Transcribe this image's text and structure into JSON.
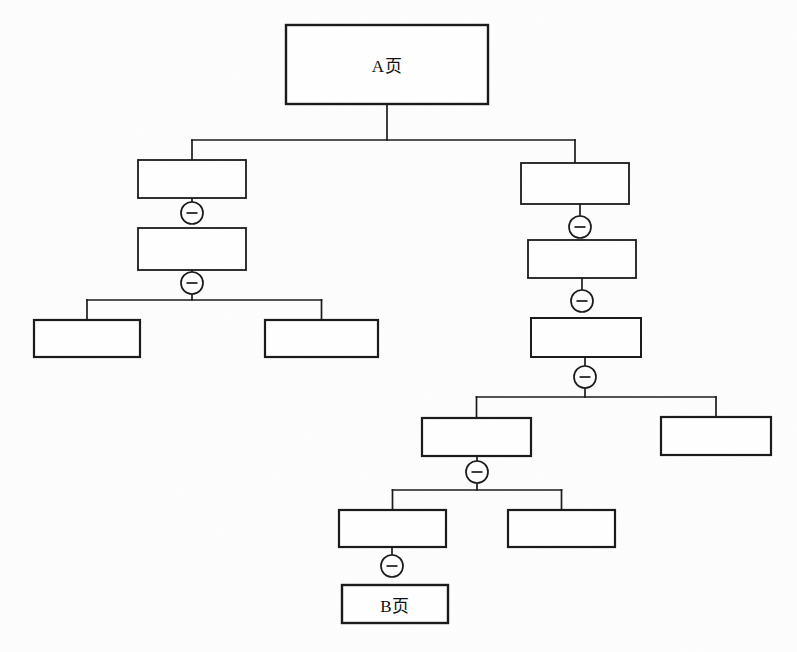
{
  "diagram": {
    "type": "tree-hierarchy",
    "title": "",
    "background_color": "#fdfdfd",
    "line_color": "#1a1a1a",
    "box_fill": "#ffffff",
    "connector_symbol": "−",
    "connector_name": "minus-collapse-toggle",
    "nodes": [
      {
        "id": "n1",
        "label": "A页",
        "x": 286,
        "y": 25,
        "w": 202,
        "h": 79,
        "stroke": 2.4
      },
      {
        "id": "n2",
        "label": "",
        "x": 138,
        "y": 160,
        "w": 108,
        "h": 38,
        "stroke": 1.8
      },
      {
        "id": "n3",
        "label": "",
        "x": 138,
        "y": 228,
        "w": 108,
        "h": 42,
        "stroke": 1.8
      },
      {
        "id": "n4",
        "label": "",
        "x": 34,
        "y": 320,
        "w": 106,
        "h": 37,
        "stroke": 2.2
      },
      {
        "id": "n5",
        "label": "",
        "x": 265,
        "y": 320,
        "w": 113,
        "h": 37,
        "stroke": 2.2
      },
      {
        "id": "n6",
        "label": "",
        "x": 521,
        "y": 163,
        "w": 108,
        "h": 41,
        "stroke": 1.8
      },
      {
        "id": "n7",
        "label": "",
        "x": 528,
        "y": 240,
        "w": 108,
        "h": 38,
        "stroke": 1.8
      },
      {
        "id": "n8",
        "label": "",
        "x": 531,
        "y": 318,
        "w": 110,
        "h": 39,
        "stroke": 2.0
      },
      {
        "id": "n9",
        "label": "",
        "x": 422,
        "y": 418,
        "w": 109,
        "h": 38,
        "stroke": 2.2
      },
      {
        "id": "n10",
        "label": "",
        "x": 661,
        "y": 417,
        "w": 110,
        "h": 38,
        "stroke": 2.2
      },
      {
        "id": "n11",
        "label": "",
        "x": 339,
        "y": 510,
        "w": 107,
        "h": 37,
        "stroke": 2.2
      },
      {
        "id": "n12",
        "label": "",
        "x": 508,
        "y": 510,
        "w": 107,
        "h": 37,
        "stroke": 2.2
      },
      {
        "id": "n13",
        "label": "B页",
        "x": 342,
        "y": 585,
        "w": 106,
        "h": 38,
        "stroke": 2.4
      }
    ],
    "connectors": [
      {
        "id": "c1",
        "parent": "n2",
        "child": "n3",
        "cx": 192,
        "cy": 213
      },
      {
        "id": "c2",
        "parent": "n3",
        "child": "n4",
        "cx": 192,
        "cy": 283
      },
      {
        "id": "c3",
        "parent": "n6",
        "child": "n7",
        "cx": 580,
        "cy": 227
      },
      {
        "id": "c4",
        "parent": "n7",
        "child": "n8",
        "cx": 582,
        "cy": 301
      },
      {
        "id": "c5",
        "parent": "n8",
        "child": "n9",
        "cx": 585,
        "cy": 377
      },
      {
        "id": "c6",
        "parent": "n9",
        "child": "n11",
        "cx": 477,
        "cy": 472
      },
      {
        "id": "c7",
        "parent": "n11",
        "child": "n13",
        "cx": 392,
        "cy": 566
      }
    ],
    "edges": [
      {
        "from": "n1",
        "to": "n2",
        "style": "elbow"
      },
      {
        "from": "n1",
        "to": "n6",
        "style": "elbow"
      },
      {
        "from": "n3",
        "to": "n4",
        "style": "elbow"
      },
      {
        "from": "n3",
        "to": "n5",
        "style": "elbow"
      },
      {
        "from": "n8",
        "to": "n9",
        "style": "elbow"
      },
      {
        "from": "n8",
        "to": "n10",
        "style": "elbow"
      },
      {
        "from": "n9",
        "to": "n11",
        "style": "elbow"
      },
      {
        "from": "n9",
        "to": "n12",
        "style": "elbow"
      }
    ],
    "labels": {
      "root": "A页",
      "leaf": "B页"
    }
  }
}
